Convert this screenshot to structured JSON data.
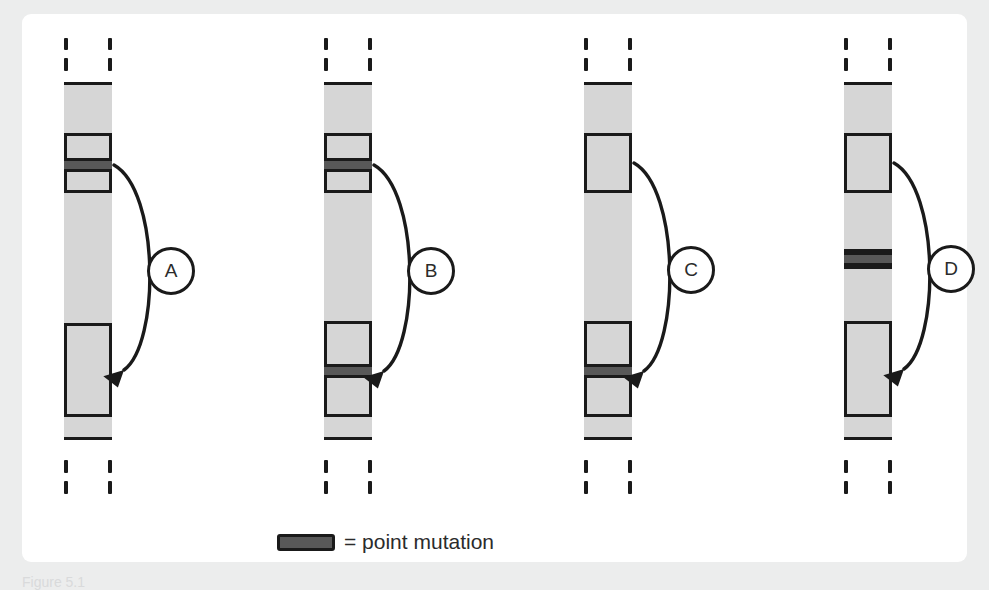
{
  "figure": {
    "caption": "Figure 5.1",
    "background_color": "#eceded",
    "card_color": "#ffffff",
    "band_colors": {
      "light": "#d6d6d6",
      "medium": "#a9a9a9",
      "dark": "#585858",
      "outline": "#1a1a1a"
    }
  },
  "legend": {
    "swatch_name": "point-mutation-swatch",
    "equals_label": "= point mutation"
  },
  "chromosomes": [
    {
      "id": "A",
      "label": "A",
      "left": 26,
      "bands": [
        {
          "shade": "light",
          "top": 0,
          "height": 54
        },
        {
          "shade": "medium",
          "top": 54,
          "height": 22
        },
        {
          "shade": "dark",
          "top": 76,
          "height": 14
        },
        {
          "shade": "medium",
          "top": 90,
          "height": 18
        },
        {
          "shade": "light",
          "top": 108,
          "height": 136
        },
        {
          "shade": "medium",
          "top": 244,
          "height": 88
        },
        {
          "shade": "light",
          "top": 332,
          "height": 26
        }
      ],
      "arrow": {
        "from_band": 2,
        "to_band": 5
      }
    },
    {
      "id": "B",
      "label": "B",
      "left": 286,
      "bands": [
        {
          "shade": "light",
          "top": 0,
          "height": 54
        },
        {
          "shade": "medium",
          "top": 54,
          "height": 22
        },
        {
          "shade": "dark",
          "top": 76,
          "height": 14
        },
        {
          "shade": "medium",
          "top": 90,
          "height": 18
        },
        {
          "shade": "light",
          "top": 108,
          "height": 134
        },
        {
          "shade": "medium",
          "top": 242,
          "height": 40
        },
        {
          "shade": "dark",
          "top": 282,
          "height": 14
        },
        {
          "shade": "medium",
          "top": 296,
          "height": 36
        },
        {
          "shade": "light",
          "top": 332,
          "height": 26
        }
      ],
      "arrow": {
        "from_band": 2,
        "to_band": 6
      }
    },
    {
      "id": "C",
      "label": "C",
      "left": 546,
      "bands": [
        {
          "shade": "light",
          "top": 0,
          "height": 54
        },
        {
          "shade": "medium",
          "top": 54,
          "height": 54
        },
        {
          "shade": "light",
          "top": 108,
          "height": 134
        },
        {
          "shade": "medium",
          "top": 242,
          "height": 40
        },
        {
          "shade": "dark",
          "top": 282,
          "height": 14
        },
        {
          "shade": "medium",
          "top": 296,
          "height": 36
        },
        {
          "shade": "light",
          "top": 332,
          "height": 26
        }
      ],
      "arrow": {
        "from_band": 1,
        "to_band": 4
      }
    },
    {
      "id": "D",
      "label": "D",
      "left": 806,
      "bands": [
        {
          "shade": "light",
          "top": 0,
          "height": 54
        },
        {
          "shade": "medium",
          "top": 54,
          "height": 54
        },
        {
          "shade": "light",
          "top": 108,
          "height": 62
        },
        {
          "shade": "dark",
          "top": 170,
          "height": 14
        },
        {
          "shade": "light",
          "top": 184,
          "height": 58
        },
        {
          "shade": "medium",
          "top": 242,
          "height": 90
        },
        {
          "shade": "light",
          "top": 332,
          "height": 26
        }
      ],
      "arrow": {
        "from_band": 1,
        "to_band": 5
      }
    }
  ]
}
